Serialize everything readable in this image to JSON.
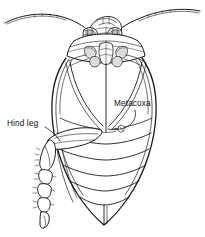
{
  "figure": {
    "style": "black-and-white-scientific-illustration",
    "background_color": "#ffffff",
    "ink_color": "#1a1a1a",
    "labels": [
      {
        "id": "hind-leg",
        "text": "Hind leg",
        "position": "left",
        "leader": "curved line from label down-right to the hind leg femur"
      },
      {
        "id": "metacoxa",
        "text": "Metacoxa",
        "position": "center-right",
        "leader": "curved line from label down-left to the metacoxal plate"
      }
    ],
    "anatomy": {
      "antennae": "two long curved antennae sweeping outward to the image edges",
      "head": "small head with two shaded compound eyes and mouthparts",
      "thorax": "prothorax with coxae of fore and mid legs",
      "metacoxa": "large paired coxal plates forming two arcs either side of the midline",
      "abdomen": "oval abdomen with transverse sternite bands tapering to a V-shaped tip",
      "hind_leg": "femur, tibia with setae, and segmented tarsus ending in a claw"
    }
  }
}
